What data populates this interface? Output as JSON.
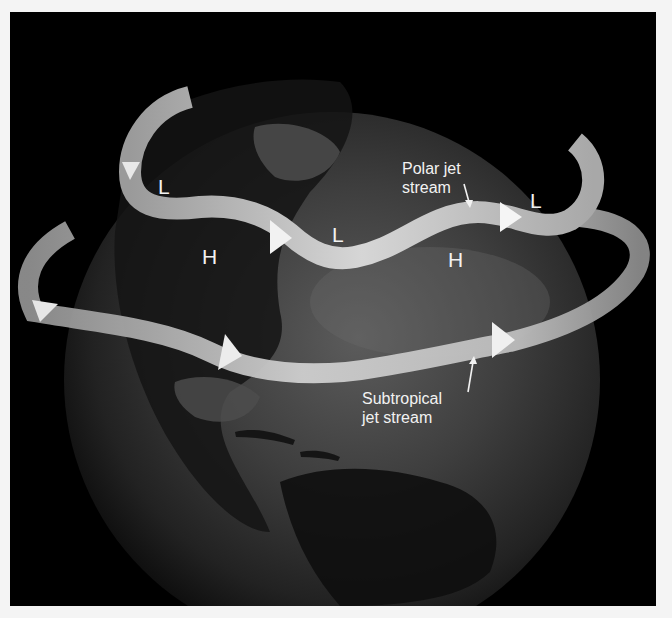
{
  "diagram": {
    "background_color": "#000000",
    "frame_color": "#f4f4f4",
    "arrow_color": "#bdbdbd",
    "label_color": "#f2f2f2",
    "labels": {
      "polar_jet": [
        "Polar jet",
        "stream"
      ],
      "subtropical_jet": [
        "Subtropical",
        "jet stream"
      ]
    },
    "pressure_markers": [
      {
        "id": "low-1",
        "text": "L"
      },
      {
        "id": "low-2",
        "text": "L"
      },
      {
        "id": "low-3",
        "text": "L"
      },
      {
        "id": "high-1",
        "text": "H"
      },
      {
        "id": "high-2",
        "text": "H"
      }
    ]
  }
}
